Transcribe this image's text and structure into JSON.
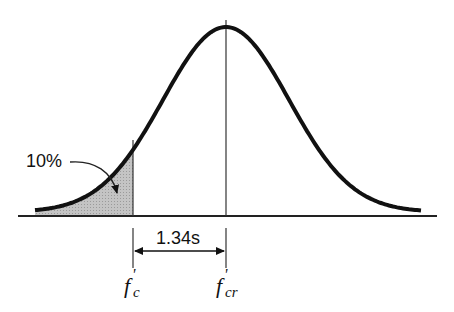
{
  "diagram": {
    "type": "normal-distribution",
    "curve": {
      "mean_x": 226,
      "peak_y": 27,
      "sigma_px": 63,
      "stroke": "#111111",
      "stroke_width": 4
    },
    "shaded_region": {
      "label": "10%",
      "fill": "#bfbfbf",
      "boundary": "f'c"
    },
    "dimension": {
      "label": "1.34s"
    },
    "axis_labels": {
      "left": {
        "main": "f",
        "prime": "'",
        "sub": "c"
      },
      "center": {
        "main": "f",
        "prime": "'",
        "sub": "cr"
      }
    }
  }
}
